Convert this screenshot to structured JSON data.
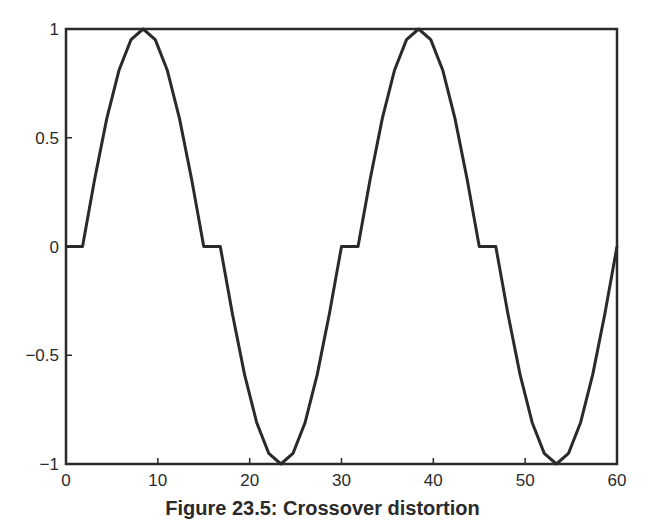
{
  "chart_data": {
    "type": "line",
    "title": "",
    "caption": "Figure 23.5: Crossover distortion",
    "xlabel": "",
    "ylabel": "",
    "xlim": [
      0,
      60
    ],
    "ylim": [
      -1,
      1
    ],
    "xticks": [
      0,
      10,
      20,
      30,
      40,
      50,
      60
    ],
    "xtick_labels": [
      "0",
      "10",
      "20",
      "30",
      "40",
      "50",
      "60"
    ],
    "yticks": [
      -1,
      -0.5,
      0,
      0.5,
      1
    ],
    "ytick_labels": [
      "−1",
      "−0.5",
      "0",
      "0.5",
      "1"
    ],
    "grid": false,
    "legend": null,
    "line_color": "#2a2a2a",
    "series": [
      {
        "name": "distorted sine",
        "x": [
          0,
          1.8,
          3.12,
          4.44,
          5.76,
          7.08,
          8.4,
          9.72,
          11.04,
          12.36,
          13.68,
          15,
          16.8,
          18.12,
          19.44,
          20.76,
          22.08,
          23.4,
          24.72,
          26.04,
          27.36,
          28.68,
          30,
          31.8,
          33.12,
          34.44,
          35.76,
          37.08,
          38.4,
          39.72,
          41.04,
          42.36,
          43.68,
          45,
          46.8,
          48.12,
          49.44,
          50.76,
          52.08,
          53.4,
          54.72,
          56.04,
          57.36,
          58.68,
          60
        ],
        "y": [
          0,
          0,
          0.309,
          0.588,
          0.809,
          0.951,
          1,
          0.951,
          0.809,
          0.588,
          0.309,
          0,
          0,
          -0.309,
          -0.588,
          -0.809,
          -0.951,
          -1,
          -0.951,
          -0.809,
          -0.588,
          -0.309,
          0,
          0,
          0.309,
          0.588,
          0.809,
          0.951,
          1,
          0.951,
          0.809,
          0.588,
          0.309,
          0,
          0,
          -0.309,
          -0.588,
          -0.809,
          -0.951,
          -1,
          -0.951,
          -0.809,
          -0.588,
          -0.309,
          0
        ]
      }
    ]
  }
}
